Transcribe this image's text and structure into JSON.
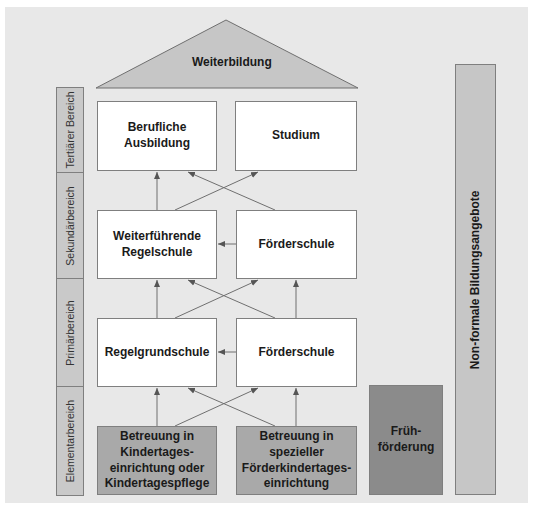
{
  "diagram": {
    "title_triangle": {
      "label": "Weiterbildung"
    },
    "stages": [
      {
        "id": "tertiary",
        "label": "Tertiärer Bereich"
      },
      {
        "id": "secondary",
        "label": "Sekundärbereich"
      },
      {
        "id": "primary",
        "label": "Primärbereich"
      },
      {
        "id": "elementary",
        "label": "Elementarbereich"
      }
    ],
    "boxes": {
      "tertiary_left": "Berufliche\nAusbildung",
      "tertiary_right": "Studium",
      "secondary_left": "Weiterführende\nRegelschule",
      "secondary_right": "Förderschule",
      "primary_left": "Regelgrundschule",
      "primary_right": "Förderschule",
      "elementary_left": "Betreuung in\nKindertages-\neinrichtung oder\nKindertagespflege",
      "elementary_right": "Betreuung in\nspezieller\nFörderkindertages-\neinrichtung"
    },
    "early_support": {
      "label": "Früh-\nförderung"
    },
    "non_formal": {
      "label": "Non-formale Bildungsangebote"
    },
    "colors": {
      "panel": "#e8e8e8",
      "white_box": "#ffffff",
      "elementary_box": "#a9a9a9",
      "early_support_box": "#8b8b8b",
      "light_gray": "#c6c6c6",
      "line": "#6f6f6f"
    }
  }
}
